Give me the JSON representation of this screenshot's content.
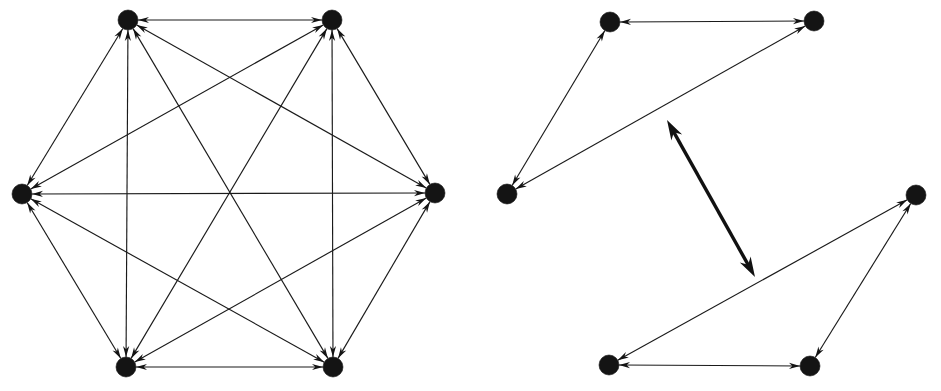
{
  "figure": {
    "background_color": "#ffffff",
    "ink_color": "#141414",
    "width": 941,
    "height": 391,
    "panel_count": 2
  },
  "chart_data": {
    "type": "diagram",
    "subtype": "directed-graph",
    "panels": [
      {
        "id": "left-graph",
        "name": "complete-digraph-k6",
        "label": "",
        "node_radius": 10,
        "edge_style": "thin",
        "arrowheads": "both-ends",
        "node_count": 6,
        "edge_count": 15,
        "nodes": [
          {
            "id": "L1",
            "label": "",
            "x": 128,
            "y": 20
          },
          {
            "id": "L2",
            "label": "",
            "x": 332,
            "y": 20
          },
          {
            "id": "L3",
            "label": "",
            "x": 435,
            "y": 193
          },
          {
            "id": "L4",
            "label": "",
            "x": 333,
            "y": 367
          },
          {
            "id": "L5",
            "label": "",
            "x": 126,
            "y": 367
          },
          {
            "id": "L6",
            "label": "",
            "x": 22,
            "y": 194
          }
        ],
        "edges": [
          {
            "from": "L1",
            "to": "L2",
            "directed": "both",
            "weight": 1
          },
          {
            "from": "L1",
            "to": "L3",
            "directed": "both",
            "weight": 1
          },
          {
            "from": "L1",
            "to": "L4",
            "directed": "both",
            "weight": 1
          },
          {
            "from": "L1",
            "to": "L5",
            "directed": "both",
            "weight": 1
          },
          {
            "from": "L1",
            "to": "L6",
            "directed": "both",
            "weight": 1
          },
          {
            "from": "L2",
            "to": "L3",
            "directed": "both",
            "weight": 1
          },
          {
            "from": "L2",
            "to": "L4",
            "directed": "both",
            "weight": 1
          },
          {
            "from": "L2",
            "to": "L5",
            "directed": "both",
            "weight": 1
          },
          {
            "from": "L2",
            "to": "L6",
            "directed": "both",
            "weight": 1
          },
          {
            "from": "L3",
            "to": "L4",
            "directed": "both",
            "weight": 1
          },
          {
            "from": "L3",
            "to": "L5",
            "directed": "both",
            "weight": 1
          },
          {
            "from": "L3",
            "to": "L6",
            "directed": "both",
            "weight": 1
          },
          {
            "from": "L4",
            "to": "L5",
            "directed": "both",
            "weight": 1
          },
          {
            "from": "L4",
            "to": "L6",
            "directed": "both",
            "weight": 1
          },
          {
            "from": "L5",
            "to": "L6",
            "directed": "both",
            "weight": 1
          }
        ]
      },
      {
        "id": "right-graph",
        "name": "two-triangles-with-bridge",
        "label": "",
        "node_radius": 10,
        "edge_style": "thin",
        "arrowheads": "both-ends",
        "node_count": 6,
        "edge_count": 7,
        "nodes": [
          {
            "id": "R1",
            "label": "",
            "x": 610,
            "y": 22
          },
          {
            "id": "R2",
            "label": "",
            "x": 814,
            "y": 21
          },
          {
            "id": "R3",
            "label": "",
            "x": 507,
            "y": 194
          },
          {
            "id": "R4",
            "label": "",
            "x": 916,
            "y": 195
          },
          {
            "id": "R5",
            "label": "",
            "x": 609,
            "y": 365
          },
          {
            "id": "R6",
            "label": "",
            "x": 810,
            "y": 366
          }
        ],
        "edges": [
          {
            "from": "R1",
            "to": "R2",
            "directed": "both",
            "weight": 1,
            "style": "thin"
          },
          {
            "from": "R1",
            "to": "R3",
            "directed": "both",
            "weight": 1,
            "style": "thin"
          },
          {
            "from": "R2",
            "to": "R3",
            "directed": "both",
            "weight": 1,
            "style": "thin"
          },
          {
            "from": "R4",
            "to": "R5",
            "directed": "both",
            "weight": 1,
            "style": "thin"
          },
          {
            "from": "R4",
            "to": "R6",
            "directed": "both",
            "weight": 1,
            "style": "thin"
          },
          {
            "from": "R5",
            "to": "R6",
            "directed": "both",
            "weight": 1,
            "style": "thin"
          }
        ],
        "free_arrow": {
          "id": "bridge-arrow",
          "label": "",
          "directed": "both",
          "style": "thick",
          "x1": 755,
          "y1": 277,
          "x2": 667,
          "y2": 120
        }
      }
    ],
    "legend": [],
    "annotations": []
  }
}
